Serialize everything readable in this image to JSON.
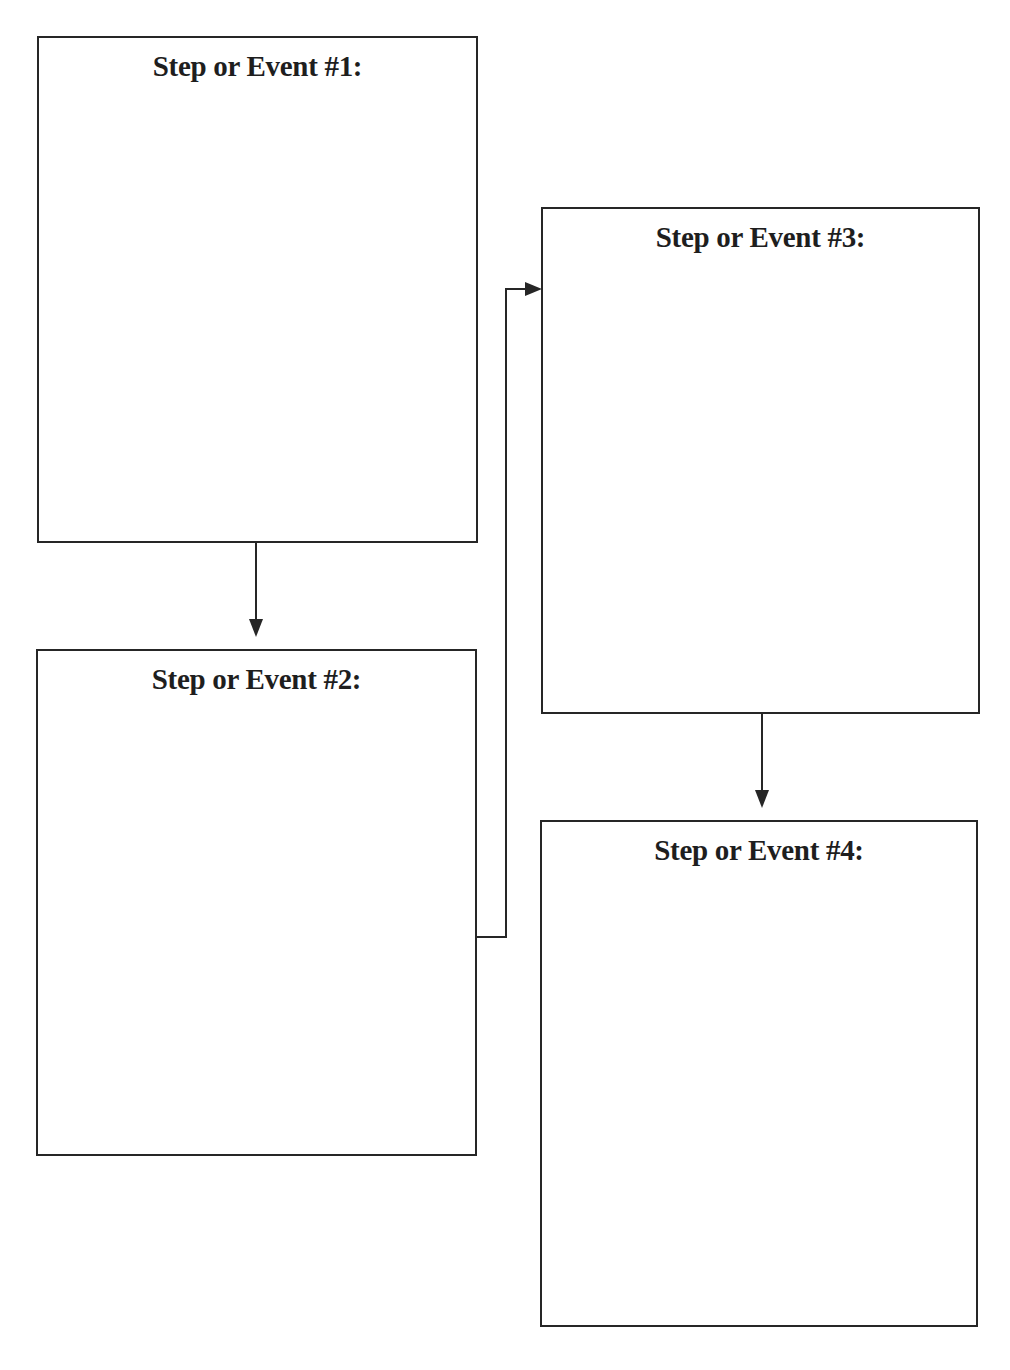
{
  "diagram": {
    "type": "sequence-flowchart",
    "steps": [
      {
        "id": 1,
        "title": "Step or Event #1:",
        "content": ""
      },
      {
        "id": 2,
        "title": "Step or Event #2:",
        "content": ""
      },
      {
        "id": 3,
        "title": "Step or Event #3:",
        "content": ""
      },
      {
        "id": 4,
        "title": "Step or Event #4:",
        "content": ""
      }
    ],
    "edges": [
      {
        "from": 1,
        "to": 2
      },
      {
        "from": 2,
        "to": 3
      },
      {
        "from": 3,
        "to": 4
      }
    ],
    "colors": {
      "line": "#262626",
      "background": "#ffffff",
      "text": "#1e1e1e"
    }
  }
}
